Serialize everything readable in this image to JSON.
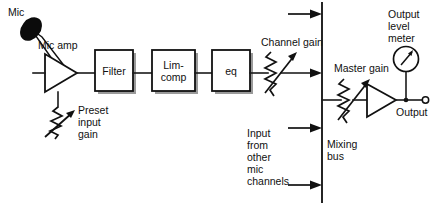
{
  "diagram": {
    "type": "block-schematic",
    "colors": {
      "ink": "#111111",
      "background": "#ffffff",
      "shadow": "#9a9a9a"
    },
    "source_labels": {
      "mic": "Mic",
      "mic_amp": "Mic amp",
      "preset_input_gain": "Preset\ninput\ngain",
      "preset_input_gain_line1": "Preset",
      "preset_input_gain_line2": "input",
      "preset_input_gain_line3": "gain"
    },
    "blocks": [
      {
        "name": "filter",
        "label": "Filter",
        "label_line1": "Filter",
        "label_line2": ""
      },
      {
        "name": "lim-comp",
        "label": "Lim-comp",
        "label_line1": "Lim-",
        "label_line2": "comp"
      },
      {
        "name": "eq",
        "label": "eq",
        "label_line1": "eq",
        "label_line2": ""
      }
    ],
    "controls": {
      "channel_gain": "Channel gain",
      "master_gain": "Master gain"
    },
    "bus": {
      "label_line1": "Mixing",
      "label_line2": "bus",
      "label": "Mixing bus",
      "input_label_line1": "Input",
      "input_label_line2": "from",
      "input_label_line3": "other",
      "input_label_line4": "mic",
      "input_label_line5": "channels",
      "input_label": "Input from other mic channels"
    },
    "output": {
      "meter_line1": "Output",
      "meter_line2": "level",
      "meter_line3": "meter",
      "meter_label": "Output level meter",
      "terminal_label": "Output"
    }
  }
}
